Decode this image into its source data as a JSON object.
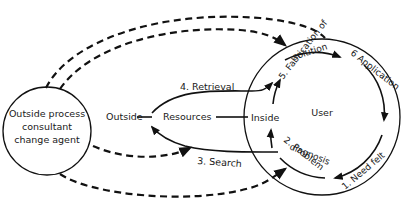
{
  "diagram": {
    "nodes": {
      "consultant": {
        "label_lines": [
          "Outside process",
          "consultant",
          "change agent"
        ]
      },
      "user": {
        "label": "User"
      },
      "outside": {
        "label": "Outside"
      },
      "resources": {
        "label": "Resources"
      },
      "inside": {
        "label": "Inside"
      }
    },
    "steps": [
      {
        "id": "need-felt",
        "label": "1. Need felt"
      },
      {
        "id": "problem-diagnosis",
        "label_lines": [
          "2. Problem",
          "diagnosis"
        ]
      },
      {
        "id": "search",
        "label": "3. Search"
      },
      {
        "id": "retrieval",
        "label": "4. Retrieval"
      },
      {
        "id": "fabrication",
        "label_lines": [
          "5. Fabrication of",
          "solution"
        ]
      },
      {
        "id": "application",
        "label": "6 Application"
      }
    ],
    "colors": {
      "ink": "#111111",
      "background": "#ffffff"
    }
  }
}
